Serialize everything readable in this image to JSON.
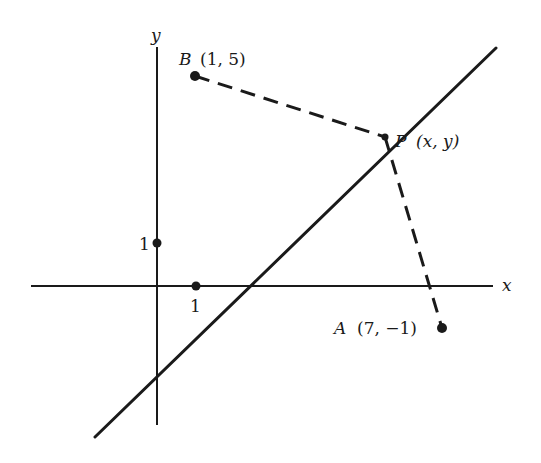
{
  "diagram": {
    "type": "coordinate-plane",
    "axes": {
      "x_label": "x",
      "y_label": "y",
      "tick_x_label": "1",
      "tick_y_label": "1"
    },
    "points": [
      {
        "id": "B",
        "name": "B",
        "coords": "(1, 5)"
      },
      {
        "id": "P",
        "name": "P",
        "coords": "(x, y)"
      },
      {
        "id": "A",
        "name": "A",
        "coords": "(7, −1)"
      }
    ],
    "segments": [
      {
        "from": "B",
        "to": "P",
        "style": "dashed"
      },
      {
        "from": "P",
        "to": "A",
        "style": "dashed"
      }
    ],
    "line": {
      "description": "line through P (perpendicular bisector of AB)",
      "style": "solid"
    },
    "colors": {
      "stroke": "#1a1a1a",
      "background": "#ffffff"
    }
  }
}
